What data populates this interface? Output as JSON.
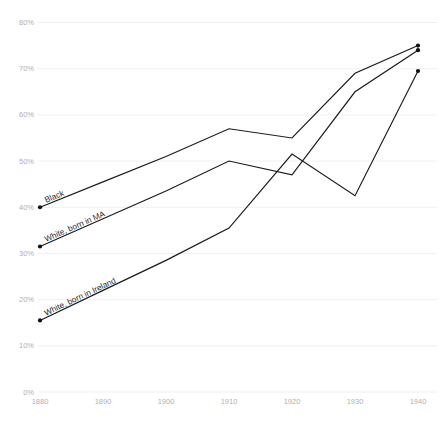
{
  "corner_mark": "",
  "chart_data": {
    "type": "line",
    "title": "",
    "subtitle": "",
    "xlabel": "",
    "ylabel": "",
    "x": [
      1880,
      1890,
      1900,
      1910,
      1920,
      1930,
      1940
    ],
    "xtick_labels": [
      "1880",
      "1890",
      "1900",
      "1910",
      "1920",
      "1930",
      "1940"
    ],
    "ytick_labels": [
      "0%",
      "10%",
      "20%",
      "30%",
      "40%",
      "50%",
      "60%",
      "70%",
      "80%"
    ],
    "ytick_values": [
      0,
      10,
      20,
      30,
      40,
      50,
      60,
      70,
      80
    ],
    "xlim": [
      1880,
      1940
    ],
    "ylim": [
      0,
      80
    ],
    "grid": "horizontal",
    "legend": "inline-labels-at-line-start",
    "series": [
      {
        "name": "Black",
        "label": "Black",
        "color": "#1a1a1a",
        "values": [
          40,
          45.5,
          51,
          57,
          55,
          69,
          75
        ]
      },
      {
        "name": "White, born in MA",
        "label": "White, born in MA",
        "color": "#1a1a1a",
        "values": [
          31.5,
          37.5,
          43.5,
          50,
          47,
          65,
          74
        ]
      },
      {
        "name": "White, born in Ireland",
        "label": "White, born in Ireland",
        "color": "#1a1a1a",
        "values": [
          15.5,
          22,
          28.5,
          35.5,
          51.5,
          42.5,
          69.5
        ]
      }
    ],
    "annotations": [
      {
        "text": "Black",
        "series": "Black",
        "rotated": true
      },
      {
        "text": "White, born in MA",
        "series": "White, born in MA",
        "rotated": true
      },
      {
        "text": "White, born in Ireland",
        "series": "White, born in Ireland",
        "rotated": true
      }
    ]
  }
}
